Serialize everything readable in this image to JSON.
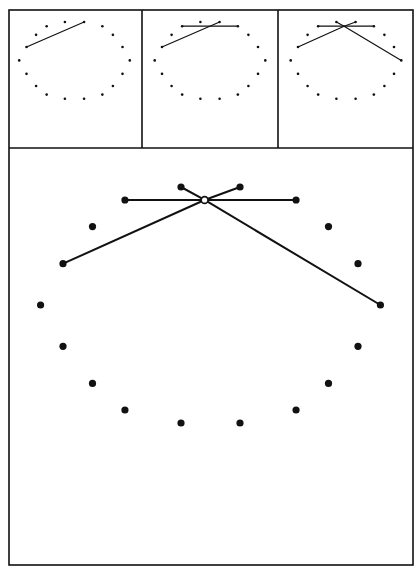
{
  "figure": {
    "stroke_color": "#111111",
    "background": "#ffffff",
    "frame": {
      "left": 9,
      "top": 10,
      "right": 413,
      "bottom": 565,
      "divider_y": 148,
      "divider_x": [
        142,
        278
      ]
    }
  },
  "points_unit": [
    [
      -0.5,
      -1.0
    ],
    [
      0.5,
      -1.0
    ],
    [
      -1.45,
      -0.78
    ],
    [
      1.45,
      -0.78
    ],
    [
      -2.0,
      -0.33
    ],
    [
      2.0,
      -0.33
    ],
    [
      -2.5,
      0.3
    ],
    [
      2.5,
      0.3
    ],
    [
      -2.88,
      1.0
    ],
    [
      2.88,
      1.0
    ],
    [
      -2.5,
      1.7
    ],
    [
      2.5,
      1.7
    ],
    [
      -2.0,
      2.33
    ],
    [
      2.0,
      2.33
    ],
    [
      -1.45,
      2.78
    ],
    [
      1.45,
      2.78
    ],
    [
      -0.5,
      3.0
    ],
    [
      0.5,
      3.0
    ]
  ],
  "panels": [
    {
      "name": "step-1",
      "origin": [
        74.5,
        22
      ],
      "scale": 19.2,
      "dot_r": 1.3,
      "stroke_w": 1.2,
      "hub": null,
      "segments": [
        [
          6,
          1
        ]
      ]
    },
    {
      "name": "step-2",
      "origin": [
        210,
        22
      ],
      "scale": 19.2,
      "dot_r": 1.3,
      "stroke_w": 1.2,
      "hub": null,
      "segments": [
        [
          6,
          1
        ],
        [
          2,
          3
        ]
      ]
    },
    {
      "name": "step-3",
      "origin": [
        346,
        22
      ],
      "scale": 19.2,
      "dot_r": 1.3,
      "stroke_w": 1.2,
      "hub": [
        -0.1,
        -0.78
      ],
      "segments": [
        [
          6,
          "hub"
        ],
        [
          "hub",
          1
        ],
        [
          2,
          3
        ],
        [
          0,
          "hub"
        ],
        [
          "hub",
          9
        ]
      ]
    },
    {
      "name": "step-4-enlarged",
      "origin": [
        210.5,
        187
      ],
      "scale": 59,
      "dot_r": 3.6,
      "stroke_w": 2,
      "hub": [
        -0.1,
        -0.78
      ],
      "hub_open": true,
      "hub_r": 3.4,
      "segments": [
        [
          6,
          "hub"
        ],
        [
          "hub",
          1
        ],
        [
          2,
          3
        ],
        [
          0,
          "hub"
        ],
        [
          "hub",
          9
        ]
      ]
    }
  ]
}
